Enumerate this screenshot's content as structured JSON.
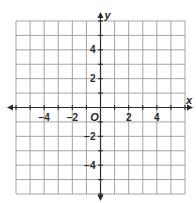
{
  "chart_data": {
    "type": "scatter",
    "title": "",
    "xlabel": "x",
    "ylabel": "y",
    "origin_label": "O",
    "xlim": [
      -6,
      6
    ],
    "ylim": [
      -6,
      6
    ],
    "grid": true,
    "grid_step": 1,
    "x_ticks": [
      -4,
      -2,
      2,
      4
    ],
    "x_tick_labels": [
      "−4",
      "−2",
      "2",
      "4"
    ],
    "y_ticks": [
      4,
      2,
      -2,
      -4
    ],
    "y_tick_labels": [
      "4",
      "2",
      "−2",
      "−4"
    ],
    "minor_tick_step": 1,
    "axis_arrows": "both-directions",
    "points": [],
    "colors": {
      "grid": "#9a9a9a",
      "axis": "#2a2a2a",
      "background": "#ffffff"
    }
  }
}
